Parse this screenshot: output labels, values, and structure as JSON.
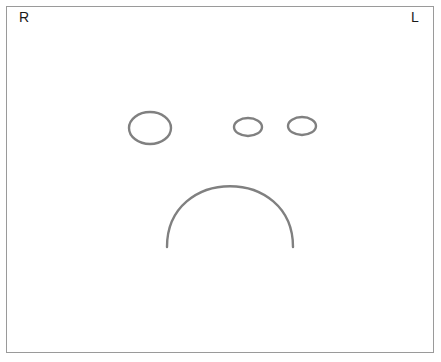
{
  "figure": {
    "background_color": "#ffffff",
    "frame": {
      "border_color": "#9a9a9a",
      "x": 6,
      "y": 6,
      "width": 428,
      "height": 347
    },
    "stroke_color": "#808080",
    "stroke_width": 2.2
  },
  "labels": {
    "right": "R",
    "left": "L"
  },
  "shapes": [
    {
      "name": "large-ellipse",
      "type": "ellipse",
      "cx": 150,
      "cy": 128,
      "rx": 21,
      "ry": 16
    },
    {
      "name": "middle-small-ellipse",
      "type": "ellipse",
      "cx": 248,
      "cy": 127,
      "rx": 14,
      "ry": 9
    },
    {
      "name": "right-small-ellipse",
      "type": "ellipse",
      "cx": 302,
      "cy": 126,
      "rx": 14,
      "ry": 9
    },
    {
      "name": "inverted-u-arc",
      "type": "arc",
      "left_x": 167,
      "right_x": 293,
      "bottom_y": 247,
      "top_y": 166
    }
  ]
}
